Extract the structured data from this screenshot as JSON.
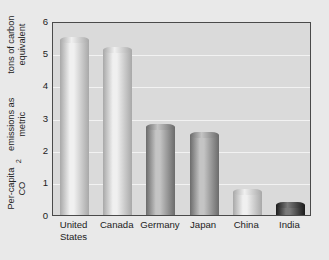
{
  "chart_data": {
    "type": "bar",
    "title": "",
    "subtitle": "",
    "xlabel": "",
    "ylabel_line1": "Per-capita CO",
    "ylabel_sub": "2",
    "ylabel_line1b": " emissions as metric",
    "ylabel_line2": "tons of carbon equivalent",
    "ylabel_full": "Per-capita CO2 emissions as metric tons of carbon equivalent",
    "categories": [
      "United\nStates",
      "Canada",
      "Germany",
      "Japan",
      "China",
      "India"
    ],
    "category_names": [
      "United States",
      "Canada",
      "Germany",
      "Japan",
      "China",
      "India"
    ],
    "values": [
      5.4,
      5.1,
      2.7,
      2.45,
      0.7,
      0.28
    ],
    "ylim": [
      0,
      6
    ],
    "ytick_labels": [
      "0",
      "1",
      "2",
      "3",
      "4",
      "5",
      "6"
    ],
    "ytick_values": [
      0,
      1,
      2,
      3,
      4,
      5,
      6
    ],
    "grid": true,
    "grid_orientation": "horizontal",
    "legend": "none",
    "legend_position": "none",
    "bar_styles": [
      "light",
      "light",
      "dark",
      "dark",
      "light",
      "darkest"
    ],
    "colors": {
      "figure_background": "#e9e9e9",
      "plot_background": "#dadada",
      "plot_border": "#4a4a4a",
      "gridline": "#f2f2f2",
      "text": "#1c1c1c",
      "bar_light_mid": "#f0f0f0",
      "bar_light_edge": "#a8a8a8",
      "bar_dark_mid": "#c4c4c4",
      "bar_dark_edge": "#6b6b6b",
      "bar_darkest_mid": "#7a7a7a",
      "bar_darkest_edge": "#1a1a1a"
    }
  }
}
